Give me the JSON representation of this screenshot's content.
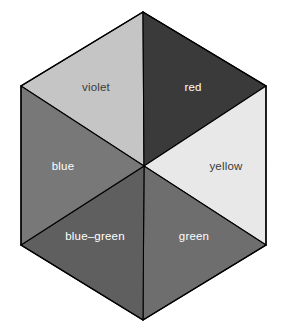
{
  "diagram": {
    "shape": "hexagon",
    "segment_count": 6,
    "background_color": "#ffffff",
    "outline_color": "#000000",
    "segments": [
      {
        "name": "violet",
        "label": "violet",
        "position": "top-left",
        "fill": "#c5c5c5",
        "label_color": "#3a3a3a",
        "label_x": 96,
        "label_y": 91
      },
      {
        "name": "red",
        "label": "red",
        "position": "top-right",
        "fill": "#3a3a3a",
        "label_color": "#ffffff",
        "label_x": 193,
        "label_y": 91
      },
      {
        "name": "yellow",
        "label": "yellow",
        "position": "right",
        "fill": "#e8e8e8",
        "label_color": "#3a3a3a",
        "label_x": 226,
        "label_y": 166
      },
      {
        "name": "green",
        "label": "green",
        "position": "bottom-right",
        "fill": "#6e6e6e",
        "label_color": "#ffffff",
        "label_x": 194,
        "label_y": 236
      },
      {
        "name": "blue-green",
        "label": "blue–green",
        "position": "bottom-left",
        "fill": "#5f5f5f",
        "label_color": "#ffffff",
        "label_x": 95,
        "label_y": 236
      },
      {
        "name": "blue",
        "label": "blue",
        "position": "left",
        "fill": "#787878",
        "label_color": "#ffffff",
        "label_x": 63,
        "label_y": 166
      }
    ],
    "geometry": {
      "center_x": 144,
      "center_y": 166,
      "vertex_top_x": 143,
      "vertex_top_y": 12,
      "vertex_top_right_x": 266,
      "vertex_top_right_y": 86,
      "vertex_bottom_right_x": 266,
      "vertex_bottom_right_y": 245,
      "vertex_bottom_x": 143,
      "vertex_bottom_y": 320,
      "vertex_bottom_left_x": 21,
      "vertex_bottom_left_y": 245,
      "vertex_top_left_x": 21,
      "vertex_top_left_y": 86
    }
  }
}
